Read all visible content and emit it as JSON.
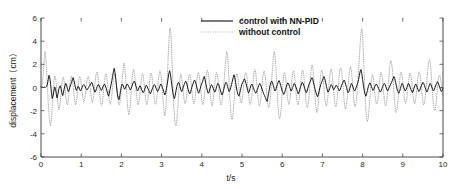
{
  "chart_data": {
    "type": "line",
    "title": "",
    "xlabel": "t/s",
    "ylabel": "displacement（cm）",
    "xlim": [
      0,
      10
    ],
    "ylim": [
      -6,
      6
    ],
    "xticks": [
      0,
      1,
      2,
      3,
      4,
      5,
      6,
      7,
      8,
      9,
      10
    ],
    "yticks": [
      -6,
      -4,
      -2,
      0,
      2,
      4,
      6
    ],
    "xtick_labels": [
      "0",
      "1",
      "2",
      "3",
      "4",
      "5",
      "6",
      "7",
      "8",
      "9",
      "10"
    ],
    "ytick_labels": [
      "-6",
      "-4",
      "-2",
      "0",
      "2",
      "4",
      "6"
    ],
    "grid": false,
    "legend_position": "top-center",
    "legend": [
      {
        "label": "control with NN-PID",
        "style": "solid",
        "color": "#101010"
      },
      {
        "label": "without control",
        "style": "dotted",
        "color": "#9a9a9a"
      }
    ],
    "series": [
      {
        "name": "control with NN-PID",
        "style": "solid",
        "color": "#101010",
        "x_start": 0.0,
        "x_step": 0.02,
        "values": [
          0.05,
          0.02,
          0.04,
          0.0,
          0.03,
          -0.02,
          0.05,
          0.1,
          0.3,
          0.7,
          1.05,
          0.8,
          0.25,
          -0.45,
          -0.95,
          -0.75,
          -0.3,
          0.05,
          -0.1,
          -0.55,
          -0.9,
          -0.6,
          -0.2,
          0.05,
          0.15,
          -0.1,
          -0.45,
          -0.7,
          -0.4,
          -0.05,
          0.2,
          0.35,
          0.15,
          -0.15,
          -0.35,
          -0.2,
          0.05,
          0.25,
          0.45,
          0.7,
          0.85,
          0.6,
          0.25,
          -0.05,
          -0.25,
          -0.1,
          0.1,
          0.05,
          -0.15,
          -0.3,
          -0.2,
          0.0,
          0.15,
          0.25,
          0.2,
          0.05,
          -0.1,
          -0.2,
          -0.15,
          0.0,
          0.1,
          0.2,
          0.35,
          0.45,
          0.3,
          0.05,
          -0.2,
          -0.4,
          -0.3,
          -0.1,
          0.1,
          0.25,
          0.2,
          0.05,
          -0.1,
          -0.25,
          -0.15,
          0.05,
          0.2,
          0.3,
          0.15,
          -0.05,
          -0.3,
          -0.55,
          -0.75,
          -0.5,
          -0.15,
          0.2,
          0.55,
          0.95,
          1.35,
          1.65,
          1.3,
          0.7,
          0.05,
          -0.55,
          -0.9,
          -1.05,
          -0.7,
          -0.25,
          0.1,
          0.3,
          0.2,
          0.0,
          -0.15,
          -0.05,
          0.15,
          0.3,
          0.25,
          0.1,
          -0.05,
          -0.2,
          -0.1,
          0.1,
          0.3,
          0.45,
          0.55,
          0.4,
          0.15,
          -0.1,
          -0.3,
          -0.2,
          0.0,
          0.15,
          0.05,
          -0.15,
          -0.3,
          -0.45,
          -0.35,
          -0.15,
          0.05,
          0.2,
          0.1,
          -0.1,
          -0.25,
          -0.4,
          -0.55,
          -0.4,
          -0.2,
          0.0,
          0.15,
          0.25,
          0.15,
          -0.05,
          -0.2,
          -0.35,
          -0.25,
          -0.05,
          0.15,
          0.3,
          0.2,
          0.0,
          -0.2,
          -0.45,
          -0.65,
          -0.45,
          -0.1,
          0.3,
          0.75,
          1.2,
          1.45,
          1.15,
          0.6,
          0.05,
          -0.45,
          -0.8,
          -0.95,
          -0.65,
          -0.25,
          0.1,
          0.35,
          0.45,
          0.3,
          0.05,
          -0.2,
          -0.35,
          -0.2,
          0.05,
          0.25,
          0.4,
          0.55,
          0.4,
          0.15,
          -0.15,
          -0.4,
          -0.55,
          -0.4,
          -0.15,
          0.1,
          0.3,
          0.5,
          0.65,
          0.5,
          0.25,
          -0.05,
          -0.3,
          -0.5,
          -0.35,
          -0.1,
          0.15,
          0.35,
          0.5,
          0.8,
          0.95,
          0.7,
          0.35,
          0.0,
          -0.3,
          -0.5,
          -0.4,
          -0.15,
          0.1,
          0.25,
          0.15,
          -0.05,
          -0.25,
          -0.4,
          -0.3,
          -0.05,
          0.2,
          0.35,
          0.25,
          0.05,
          -0.2,
          -0.45,
          -0.65,
          -0.5,
          -0.25,
          0.05,
          0.3,
          0.45,
          0.35,
          0.1,
          -0.15,
          -0.35,
          -0.25,
          0.0,
          0.25,
          0.55,
          0.85,
          1.1,
          0.85,
          0.45,
          0.05,
          -0.35,
          -0.6,
          -0.75,
          -0.55,
          -0.25,
          0.05,
          0.3,
          0.45,
          0.6,
          0.75,
          0.6,
          0.35,
          0.05,
          -0.25,
          -0.45,
          -0.35,
          -0.1,
          0.15,
          0.3,
          0.2,
          0.0,
          -0.2,
          -0.35,
          -0.5,
          -0.4,
          -0.2,
          0.0,
          0.2,
          0.35,
          0.25,
          0.05,
          -0.15,
          -0.35,
          -0.55,
          -0.7,
          -0.85,
          -1.05,
          -1.2,
          -0.95,
          -0.55,
          -0.15,
          0.2,
          0.45,
          0.55,
          0.4,
          0.15,
          -0.1,
          -0.3,
          -0.2,
          0.05,
          0.25,
          0.45,
          0.6,
          0.45,
          0.2,
          -0.05,
          -0.3,
          -0.45,
          -0.6,
          -0.45,
          -0.2,
          0.05,
          0.25,
          0.4,
          0.3,
          0.1,
          -0.1,
          -0.3,
          -0.2,
          0.0,
          0.2,
          0.35,
          0.25,
          0.05,
          -0.15,
          -0.35,
          -0.55,
          -0.4,
          -0.15,
          0.1,
          0.3,
          0.45,
          0.35,
          0.15,
          -0.1,
          -0.3,
          -0.45,
          -0.3,
          -0.05,
          0.2,
          0.4,
          0.55,
          0.7,
          0.85,
          0.7,
          0.4,
          0.1,
          -0.2,
          -0.45,
          -0.65,
          -0.8,
          -0.6,
          -0.3,
          0.0,
          0.25,
          0.45,
          0.6,
          0.8,
          0.95,
          0.75,
          0.45,
          0.1,
          -0.2,
          -0.4,
          -0.3,
          -0.1,
          0.1,
          0.25,
          0.15,
          -0.05,
          -0.2,
          -0.1,
          0.05,
          0.2,
          0.15,
          0.0,
          -0.15,
          -0.3,
          -0.2,
          0.0,
          0.2,
          0.35,
          0.5,
          0.65,
          0.5,
          0.25,
          0.0,
          -0.25,
          -0.45,
          -0.35,
          -0.1,
          0.15,
          0.35,
          0.25,
          0.05,
          -0.15,
          -0.3,
          -0.2,
          0.0,
          0.2,
          0.4,
          0.7,
          1.05,
          1.4,
          1.55,
          1.2,
          0.7,
          0.2,
          -0.25,
          -0.55,
          -0.75,
          -0.55,
          -0.25,
          0.05,
          0.25,
          0.4,
          0.3,
          0.1,
          -0.1,
          -0.25,
          -0.15,
          0.05,
          0.2,
          0.3,
          0.2,
          0.05,
          -0.1,
          -0.25,
          -0.4,
          -0.3,
          -0.1,
          0.1,
          0.25,
          0.35,
          0.25,
          0.05,
          -0.15,
          -0.3,
          -0.2,
          0.0,
          0.15,
          0.3,
          0.45,
          0.6,
          0.8,
          0.95,
          0.75,
          0.45,
          0.15,
          -0.15,
          -0.35,
          -0.5,
          -0.35,
          -0.1,
          0.15,
          0.35,
          0.25,
          0.05,
          -0.15,
          -0.3,
          -0.2,
          0.0,
          0.2,
          0.35,
          0.25,
          0.05,
          -0.15,
          -0.3,
          -0.45,
          -0.3,
          -0.05,
          0.15,
          0.3,
          0.2,
          0.0,
          -0.2,
          -0.35,
          -0.25,
          -0.05,
          0.15,
          0.3,
          0.45,
          0.35,
          0.15,
          -0.05,
          -0.25,
          -0.4,
          -0.25,
          0.0,
          0.2,
          0.35,
          0.25,
          0.05,
          -0.15,
          -0.3,
          -0.2,
          0.0,
          0.2,
          0.35,
          0.5,
          0.4,
          0.2,
          0.0,
          -0.2,
          -0.35,
          -0.25,
          -0.05
        ]
      },
      {
        "name": "without control",
        "style": "dotted",
        "color": "#9a9a9a",
        "x_start": 0.0,
        "x_step": 0.02,
        "values": [
          0.1,
          0.2,
          0.6,
          1.4,
          2.4,
          3.1,
          2.6,
          1.4,
          0.0,
          -1.3,
          -2.4,
          -3.1,
          -3.3,
          -2.7,
          -1.6,
          -0.4,
          0.5,
          1.0,
          0.9,
          0.3,
          -0.6,
          -1.4,
          -1.9,
          -1.8,
          -1.2,
          -0.4,
          0.3,
          0.8,
          0.9,
          0.5,
          -0.2,
          -0.9,
          -1.4,
          -1.5,
          -1.1,
          -0.4,
          0.3,
          0.8,
          1.0,
          0.7,
          0.1,
          -0.6,
          -1.2,
          -1.5,
          -1.3,
          -0.7,
          0.0,
          0.6,
          0.95,
          0.85,
          0.35,
          -0.3,
          -0.9,
          -1.25,
          -1.15,
          -0.65,
          0.0,
          0.55,
          0.9,
          0.95,
          0.6,
          0.0,
          -0.6,
          -1.1,
          -1.3,
          -1.0,
          -0.4,
          0.3,
          0.9,
          1.3,
          1.35,
          0.9,
          0.2,
          -0.55,
          -1.2,
          -1.55,
          -1.45,
          -0.9,
          -0.15,
          0.55,
          1.05,
          1.2,
          0.85,
          0.2,
          -0.5,
          -1.1,
          -1.45,
          -1.3,
          -0.75,
          -0.05,
          0.6,
          1.05,
          1.15,
          0.8,
          0.15,
          -0.55,
          -1.15,
          -1.5,
          -1.4,
          -0.85,
          -0.1,
          0.7,
          1.4,
          2.1,
          1.9,
          1.1,
          0.1,
          -0.95,
          -1.85,
          -2.35,
          -2.2,
          -1.5,
          -0.55,
          0.45,
          1.2,
          1.55,
          1.35,
          0.75,
          0.0,
          -0.75,
          -1.3,
          -1.5,
          -1.2,
          -0.55,
          0.2,
          0.85,
          1.2,
          1.1,
          0.55,
          -0.2,
          -0.95,
          -1.45,
          -1.5,
          -1.05,
          -0.35,
          0.4,
          1.0,
          1.25,
          1.0,
          0.4,
          -0.35,
          -1.05,
          -1.45,
          -1.4,
          -0.9,
          -0.15,
          0.6,
          1.2,
          1.45,
          1.2,
          0.55,
          -0.3,
          -1.2,
          -2.0,
          -2.45,
          -2.1,
          -1.0,
          0.6,
          2.3,
          3.9,
          5.1,
          5.15,
          4.1,
          2.3,
          0.3,
          -1.4,
          -2.6,
          -3.2,
          -3.3,
          -2.8,
          -1.9,
          -0.8,
          0.2,
          0.9,
          1.15,
          0.9,
          0.3,
          -0.4,
          -1.05,
          -1.4,
          -1.3,
          -0.8,
          -0.1,
          0.6,
          1.05,
          1.15,
          0.8,
          0.2,
          -0.5,
          -1.1,
          -1.4,
          -1.25,
          -0.7,
          0.0,
          0.7,
          1.2,
          1.3,
          0.95,
          0.3,
          -0.45,
          -1.1,
          -1.45,
          -1.35,
          -0.85,
          -0.1,
          0.65,
          1.25,
          1.5,
          1.3,
          0.7,
          -0.1,
          -0.9,
          -1.45,
          -1.6,
          -1.25,
          -0.6,
          0.2,
          0.9,
          1.3,
          1.25,
          0.8,
          0.1,
          -0.65,
          -1.25,
          -1.5,
          -1.3,
          -0.75,
          0.0,
          0.8,
          1.7,
          2.6,
          3.1,
          2.8,
          1.8,
          0.4,
          -1.0,
          -2.1,
          -2.7,
          -2.75,
          -2.2,
          -1.3,
          -0.3,
          0.6,
          1.15,
          1.2,
          0.8,
          0.15,
          -0.55,
          -1.1,
          -1.35,
          -1.15,
          -0.6,
          0.1,
          0.8,
          1.25,
          1.3,
          0.95,
          0.3,
          -0.45,
          -1.1,
          -1.45,
          -1.35,
          -0.85,
          -0.1,
          0.7,
          1.3,
          1.55,
          1.3,
          0.65,
          -0.2,
          -1.0,
          -1.5,
          -1.6,
          -1.25,
          -0.6,
          0.2,
          0.95,
          1.4,
          1.4,
          0.95,
          0.2,
          -0.65,
          -1.35,
          -1.75,
          -1.65,
          -1.1,
          -0.25,
          0.7,
          1.7,
          2.6,
          3.1,
          2.9,
          2.0,
          0.7,
          -0.7,
          -1.85,
          -2.55,
          -2.7,
          -2.3,
          -1.5,
          -0.5,
          0.45,
          1.1,
          1.3,
          1.0,
          0.35,
          -0.45,
          -1.1,
          -1.45,
          -1.35,
          -0.85,
          -0.1,
          0.65,
          1.25,
          1.45,
          1.2,
          0.55,
          -0.25,
          -1.0,
          -1.45,
          -1.5,
          -1.1,
          -0.4,
          0.4,
          1.1,
          1.5,
          1.45,
          0.95,
          0.15,
          -0.7,
          -1.4,
          -1.75,
          -1.6,
          -1.05,
          -0.2,
          0.7,
          1.5,
          1.95,
          1.8,
          1.1,
          0.1,
          -0.95,
          -1.75,
          -2.15,
          -2.0,
          -1.35,
          -0.45,
          0.5,
          1.2,
          1.5,
          1.3,
          0.7,
          -0.1,
          -0.9,
          -1.45,
          -1.6,
          -1.3,
          -0.65,
          0.15,
          0.95,
          1.5,
          1.6,
          1.25,
          0.55,
          -0.3,
          -1.1,
          -1.6,
          -1.65,
          -1.25,
          -0.55,
          0.3,
          1.1,
          1.6,
          1.7,
          1.35,
          0.65,
          -0.25,
          -1.1,
          -1.7,
          -1.85,
          -1.5,
          -0.8,
          0.1,
          1.0,
          1.6,
          1.8,
          1.45,
          0.75,
          -0.15,
          -1.0,
          -1.55,
          -1.65,
          -1.3,
          -0.6,
          0.35,
          1.4,
          2.6,
          3.8,
          4.8,
          5.1,
          4.4,
          2.9,
          1.1,
          -0.6,
          -1.9,
          -2.7,
          -2.95,
          -2.65,
          -1.9,
          -0.95,
          0.0,
          0.75,
          1.1,
          1.0,
          0.45,
          -0.3,
          -1.0,
          -1.4,
          -1.4,
          -1.0,
          -0.3,
          0.45,
          1.05,
          1.3,
          1.1,
          0.5,
          -0.3,
          -1.05,
          -1.55,
          -1.6,
          -1.2,
          -0.5,
          0.35,
          1.2,
          1.9,
          2.3,
          2.2,
          1.6,
          0.65,
          -0.45,
          -1.4,
          -2.0,
          -2.15,
          -1.85,
          -1.15,
          -0.3,
          0.55,
          1.15,
          1.35,
          1.1,
          0.5,
          -0.25,
          -0.95,
          -1.35,
          -1.35,
          -0.95,
          -0.3,
          0.4,
          1.0,
          1.25,
          1.1,
          0.55,
          -0.2,
          -0.9,
          -1.35,
          -1.4,
          -1.05,
          -0.4,
          0.35,
          1.0,
          1.35,
          1.3,
          0.85,
          0.15,
          -0.6,
          -1.2,
          -1.5,
          -1.35,
          -0.8,
          -0.05,
          0.7,
          1.45,
          2.1,
          2.4,
          2.2,
          1.5,
          0.5,
          -0.55,
          -1.45,
          -1.95,
          -2.0,
          -1.6,
          -0.9,
          -0.1,
          0.6,
          1.0,
          1.05,
          0.75,
          0.25,
          -0.35,
          -0.8
        ]
      }
    ]
  },
  "axes": {
    "left": 41,
    "right": 443,
    "top": 18,
    "bottom": 157
  },
  "legend_box": {
    "sample_x1": 201,
    "sample_x2": 233,
    "text_x": 239,
    "row1_y": 24,
    "row2_y": 35
  }
}
